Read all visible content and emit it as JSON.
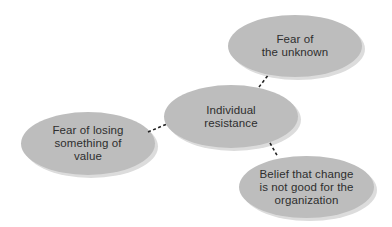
{
  "diagram": {
    "type": "mind-map",
    "colors": {
      "node_fill": "#bdbdbd",
      "node_shadow": "#dcdcdc",
      "text": "#2e2e2e",
      "connector": "#222222",
      "background": "#ffffff"
    },
    "center": {
      "label": "Individual\nresistance"
    },
    "nodes": [
      {
        "id": "fear-unknown",
        "label": "Fear of\nthe unknown"
      },
      {
        "id": "fear-losing-value",
        "label": "Fear of losing\nsomething of\nvalue"
      },
      {
        "id": "belief-change-not-good",
        "label": "Belief that change\nis not good for the\norganization"
      }
    ],
    "edges": [
      {
        "from": "center",
        "to": "fear-unknown",
        "style": "dashed"
      },
      {
        "from": "center",
        "to": "fear-losing-value",
        "style": "dashed"
      },
      {
        "from": "center",
        "to": "belief-change-not-good",
        "style": "dashed"
      }
    ]
  }
}
